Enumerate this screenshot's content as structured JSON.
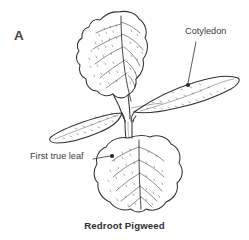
{
  "figure": {
    "panel_letter": "A",
    "caption": "Redroot Pigweed",
    "background_color": "#ffffff",
    "line_color": "#333333",
    "text_color": "#3a3a3a"
  },
  "labels": {
    "cotyledon": "Cotyledon",
    "first_true_leaf": "First true leaf"
  },
  "annotations": [
    {
      "name": "cotyledon",
      "text": "Cotyledon",
      "text_x": 185,
      "text_y": 27,
      "leader_start_x": 196,
      "leader_start_y": 42,
      "leader_end_x": 188,
      "leader_end_y": 85,
      "dot_x": 188,
      "dot_y": 85
    },
    {
      "name": "first-true-leaf",
      "text": "First true leaf",
      "text_x": 30,
      "text_y": 152,
      "leader_start_x": 93,
      "leader_start_y": 159,
      "leader_end_x": 112,
      "leader_end_y": 156,
      "dot_x": 112,
      "dot_y": 156
    }
  ],
  "plant": {
    "species_common_name": "Redroot Pigweed",
    "growth_stage": "seedling",
    "parts": [
      {
        "name": "upper-true-leaf",
        "type": "true leaf",
        "shape": "ovate with wavy scalloped margin",
        "position": "top-center",
        "tip_x": 118,
        "tip_y": 12
      },
      {
        "name": "lower-true-leaf",
        "type": "true leaf",
        "shape": "broad rounded with notched base",
        "position": "bottom-center",
        "tip_x": 141,
        "tip_y": 212
      },
      {
        "name": "left-cotyledon",
        "type": "cotyledon",
        "shape": "narrow elongated lance",
        "position": "left",
        "tip_x": 50,
        "tip_y": 133
      },
      {
        "name": "right-cotyledon",
        "type": "cotyledon",
        "shape": "narrow elongated lance",
        "position": "right",
        "tip_x": 238,
        "tip_y": 78
      },
      {
        "name": "stem",
        "type": "stem",
        "shape": "short vertical hypocotyl",
        "position": "center",
        "tip_x": 128,
        "tip_y": 130
      }
    ]
  }
}
